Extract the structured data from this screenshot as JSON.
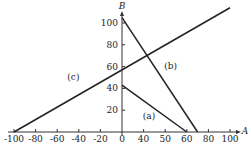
{
  "chart_data": {
    "type": "line",
    "title": "",
    "xlabel": "A",
    "ylabel": "B",
    "xlim": [
      -105,
      110
    ],
    "ylim": [
      0,
      120
    ],
    "x_ticks": [
      -100,
      -80,
      -60,
      -40,
      -20,
      0,
      20,
      40,
      60,
      80,
      100
    ],
    "x_tick_labels": [
      "-100",
      "-80",
      "-60",
      "-40",
      "-20",
      "0",
      "40",
      "50",
      "60",
      "80",
      "100"
    ],
    "y_ticks": [
      20,
      40,
      60,
      80,
      100
    ],
    "y_tick_labels": [
      "20",
      "40",
      "60",
      "80",
      "100"
    ],
    "grid": false,
    "series": [
      {
        "name": "(a)",
        "points": [
          [
            0,
            43
          ],
          [
            60,
            0
          ]
        ],
        "label_at": [
          25,
          12
        ]
      },
      {
        "name": "(b)",
        "points": [
          [
            0,
            105
          ],
          [
            70,
            0
          ]
        ],
        "label_at": [
          45,
          58
        ]
      },
      {
        "name": "(c)",
        "points": [
          [
            -100,
            0
          ],
          [
            100,
            114
          ]
        ],
        "label_at": [
          -45,
          48
        ]
      }
    ]
  }
}
